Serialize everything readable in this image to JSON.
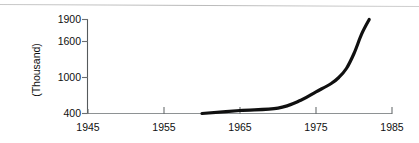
{
  "chart_data": {
    "type": "line",
    "title": "",
    "subtitle": "",
    "xlabel": "",
    "ylabel": "(Thousand)",
    "grid": false,
    "legend": null,
    "xlim": [
      1945,
      1985
    ],
    "ylim": [
      400,
      1900
    ],
    "x_ticks": [
      1945,
      1955,
      1965,
      1975,
      1985
    ],
    "x_tick_labels": [
      "1945",
      "1955",
      "1965",
      "1975",
      "1985"
    ],
    "y_ticks": [
      400,
      1000,
      1600,
      1900
    ],
    "y_tick_labels": [
      "400",
      "1000",
      "1600",
      "1900"
    ],
    "y_axis_note": "tick labels are not linearly spaced; 400, 1000, 1600, 1900 sit at roughly equal pixel intervals",
    "series": [
      {
        "name": "value",
        "x": [
          1960,
          1965,
          1970,
          1973,
          1975,
          1977,
          1978,
          1979,
          1980,
          1981,
          1982
        ],
        "values": [
          400,
          450,
          490,
          620,
          760,
          900,
          1000,
          1150,
          1400,
          1700,
          1900
        ]
      }
    ],
    "line_color": "#101010",
    "axis_color": "#555a5c",
    "background_color": "#ffffff"
  },
  "decor": {
    "top_rule": "horizontal-scan-rule"
  }
}
